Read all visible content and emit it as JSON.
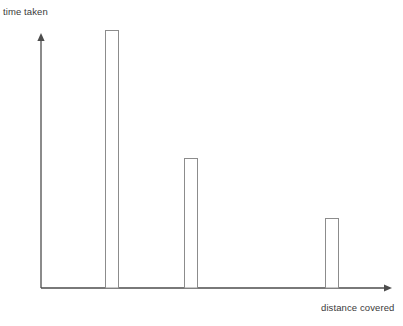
{
  "chart_data": {
    "type": "bar",
    "title": "",
    "subtitle": "",
    "xlabel": "distance covered",
    "ylabel": "time taken",
    "categories": [
      "1",
      "2",
      "3"
    ],
    "values": [
      100,
      50,
      27
    ],
    "series": [
      {
        "name": "time taken",
        "values": [
          100,
          50,
          27
        ]
      }
    ],
    "bar_tops_px": [
      30,
      158,
      218
    ],
    "bar_baseline_px": 288,
    "bar_left_px": [
      105,
      184,
      325
    ],
    "bar_width_px": 13,
    "xlim": [
      0,
      100
    ],
    "ylim": [
      0,
      100
    ],
    "grid": false,
    "legend": false,
    "legend_position": "none",
    "tick_labels_x": [],
    "tick_labels_y": [],
    "annotations": [],
    "style": {
      "bar_fill": "#ffffff",
      "bar_stroke": "#8c8c8c",
      "axis_color": "#4d4d4d",
      "background": "#ffffff",
      "text_color": "#3a3a3a"
    },
    "axes": {
      "y_axis_arrow": true,
      "x_axis_arrow": true,
      "origin_px": [
        41,
        288
      ],
      "y_axis_top_px": 34,
      "x_axis_right_px": 391
    }
  }
}
